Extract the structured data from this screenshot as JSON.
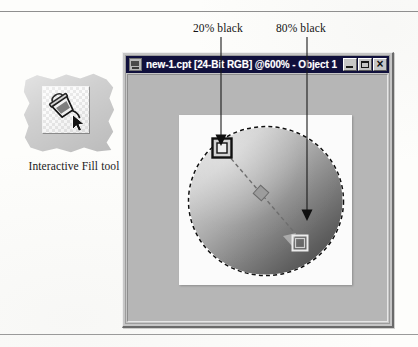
{
  "figure": {
    "tool": {
      "icon_name": "paint-bucket-fill-icon",
      "cursor_icon_name": "arrow-cursor-icon",
      "caption": "Interactive Fill tool"
    },
    "callouts": [
      {
        "id": "start-node",
        "label": "20% black"
      },
      {
        "id": "end-node",
        "label": "80% black"
      }
    ]
  },
  "window": {
    "title": "new-1.cpt [24-Bit RGB] @600% - Object 1",
    "document_name": "new-1.cpt",
    "color_mode": "24-Bit RGB",
    "zoom": "@600%",
    "object": "Object 1",
    "app_icon_name": "photo-paint-document-icon",
    "controls": [
      {
        "name": "minimize",
        "glyph": "_"
      },
      {
        "name": "maximize",
        "glyph": "□"
      },
      {
        "name": "close",
        "glyph": "×"
      }
    ]
  },
  "canvas": {
    "selection": "elliptical-marquee",
    "fill_type": "linear-gradient",
    "gradient_start_label": "20% black",
    "gradient_end_label": "80% black",
    "handles": [
      {
        "name": "gradient-start-handle",
        "style": "dark-square"
      },
      {
        "name": "gradient-midpoint-handle",
        "style": "rotated-square"
      },
      {
        "name": "gradient-end-handle",
        "style": "light-square"
      }
    ]
  },
  "colors": {
    "title_bar": "#10103c",
    "title_text": "#ffffff",
    "window_face": "#c6c6c6",
    "workspace": "#b6b6b6",
    "canvas": "#fbfbfb",
    "paper": "#fdfdfb",
    "cutout_paper": "#cfcfcf",
    "gradient_light": "#d7d7d7",
    "gradient_dark": "#4a4a4a",
    "callout_line": "#1a1a1a"
  }
}
